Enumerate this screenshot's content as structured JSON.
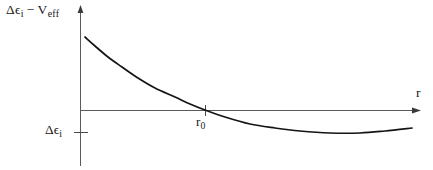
{
  "figure": {
    "type": "line-plot",
    "background_color": "#ffffff",
    "curve_color": "#141414",
    "axis_color": "#5a5a5a",
    "text_color": "#1a1a1a"
  },
  "labels": {
    "y_axis": {
      "full_text": "Δϵi − Veff",
      "delta": "Δϵ",
      "delta_sub": "i",
      "minus": "−",
      "v": "V",
      "v_sub": "eff"
    },
    "x_axis": {
      "full_text": "r",
      "symbol": "r"
    },
    "y_level": {
      "full_text": "Δϵi",
      "symbol": "Δϵ",
      "sub": "i"
    },
    "x_crossing": {
      "full_text": "r0",
      "symbol": "r",
      "sub": "0"
    }
  },
  "chart_data": {
    "type": "line",
    "title": "",
    "xlabel": "r",
    "ylabel": "Δϵi − Veff",
    "grid": false,
    "legend": null,
    "annotations": [
      {
        "name": "zero-crossing",
        "label": "r0",
        "x": 205,
        "y": 110
      },
      {
        "name": "y-level-tick",
        "label": "Δϵi",
        "x": 80,
        "y": 132
      }
    ],
    "axes": {
      "x_origin_px": 80,
      "y_zero_px": 110,
      "x_end_px": 420,
      "y_top_px": 8,
      "y_bottom_px": 165
    },
    "points": [
      {
        "x": 85,
        "y": 37
      },
      {
        "x": 95,
        "y": 46
      },
      {
        "x": 108,
        "y": 57
      },
      {
        "x": 122,
        "y": 67
      },
      {
        "x": 138,
        "y": 78
      },
      {
        "x": 155,
        "y": 88
      },
      {
        "x": 175,
        "y": 97
      },
      {
        "x": 190,
        "y": 104
      },
      {
        "x": 205,
        "y": 110
      },
      {
        "x": 225,
        "y": 117
      },
      {
        "x": 250,
        "y": 124
      },
      {
        "x": 275,
        "y": 128
      },
      {
        "x": 300,
        "y": 131
      },
      {
        "x": 330,
        "y": 133
      },
      {
        "x": 360,
        "y": 133
      },
      {
        "x": 385,
        "y": 131
      },
      {
        "x": 412,
        "y": 128
      }
    ]
  }
}
